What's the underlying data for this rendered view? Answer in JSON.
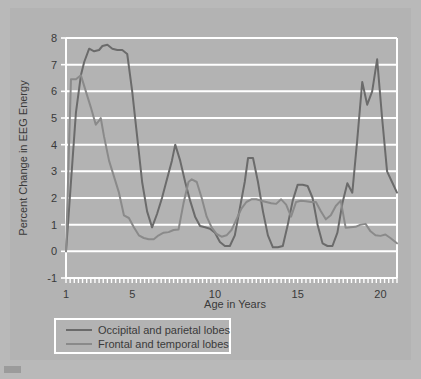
{
  "figure": {
    "background_color": "#b3b3b3",
    "page_background_color": "#b9b9b9",
    "grid_color": "#ffffff",
    "axis_color": "#ffffff",
    "text_color": "#3a3a3a"
  },
  "chart_data": {
    "type": "line",
    "title": "",
    "xlabel": "Age in Years",
    "ylabel": "Percent Change in EEG Energy",
    "xlim": [
      1,
      21
    ],
    "ylim": [
      -1,
      8
    ],
    "xticks": [
      1,
      5,
      10,
      15,
      20
    ],
    "xtick_labels": [
      "1",
      "5",
      "10",
      "15",
      "20"
    ],
    "yticks": [
      -1,
      0,
      1,
      2,
      3,
      4,
      5,
      6,
      7,
      8
    ],
    "ytick_labels": [
      "-1",
      "0",
      "1",
      "2",
      "3",
      "4",
      "5",
      "6",
      "7",
      "8"
    ],
    "minor_xticks_step": 0.25,
    "grid": "horizontal",
    "legend_position": "below-axes",
    "series": [
      {
        "name": "Occipital and parietal lobes",
        "color": "#6b6b6b",
        "x": [
          1.0,
          1.3,
          1.6,
          1.9,
          2.1,
          2.4,
          2.7,
          3.0,
          3.2,
          3.5,
          3.8,
          4.1,
          4.4,
          4.7,
          5.0,
          5.3,
          5.6,
          5.9,
          6.2,
          6.5,
          6.8,
          7.1,
          7.4,
          7.6,
          7.9,
          8.2,
          8.5,
          8.8,
          9.1,
          9.4,
          9.7,
          10.0,
          10.3,
          10.6,
          10.9,
          11.2,
          11.5,
          11.8,
          12.0,
          12.3,
          12.6,
          12.9,
          13.2,
          13.5,
          13.8,
          14.1,
          14.4,
          14.7,
          15.0,
          15.3,
          15.6,
          15.9,
          16.2,
          16.5,
          16.8,
          17.1,
          17.4,
          17.7,
          18.0,
          18.3,
          18.6,
          18.9,
          19.2,
          19.5,
          19.8,
          20.1,
          20.4,
          20.7,
          21.0
        ],
        "y": [
          0.0,
          2.6,
          5.2,
          6.6,
          7.1,
          7.6,
          7.5,
          7.55,
          7.7,
          7.75,
          7.6,
          7.55,
          7.55,
          7.4,
          6.0,
          4.3,
          2.6,
          1.5,
          0.9,
          1.4,
          2.0,
          2.7,
          3.4,
          4.0,
          3.4,
          2.6,
          1.9,
          1.3,
          0.95,
          0.9,
          0.85,
          0.7,
          0.35,
          0.2,
          0.2,
          0.6,
          1.6,
          2.6,
          3.5,
          3.5,
          2.6,
          1.5,
          0.6,
          0.15,
          0.15,
          0.2,
          1.0,
          1.9,
          2.5,
          2.5,
          2.45,
          2.0,
          1.0,
          0.3,
          0.2,
          0.2,
          0.7,
          1.8,
          2.55,
          2.2,
          4.2,
          6.35,
          5.5,
          6.0,
          7.2,
          5.0,
          3.0,
          2.6,
          2.2
        ]
      },
      {
        "name": "Frontal and temporal lobes",
        "color": "#8a8a8a",
        "x": [
          1.0,
          1.15,
          1.3,
          1.6,
          1.9,
          2.2,
          2.5,
          2.8,
          3.0,
          3.1,
          3.3,
          3.6,
          3.9,
          4.2,
          4.5,
          4.8,
          5.1,
          5.4,
          5.7,
          6.0,
          6.3,
          6.6,
          6.9,
          7.2,
          7.5,
          7.8,
          8.1,
          8.4,
          8.6,
          8.9,
          9.2,
          9.5,
          9.8,
          10.1,
          10.4,
          10.7,
          11.0,
          11.3,
          11.6,
          11.9,
          12.2,
          12.5,
          12.8,
          13.1,
          13.4,
          13.7,
          14.0,
          14.3,
          14.6,
          14.9,
          15.2,
          15.5,
          15.8,
          16.1,
          16.4,
          16.7,
          17.0,
          17.3,
          17.6,
          17.9,
          18.2,
          18.5,
          18.8,
          19.1,
          19.4,
          19.7,
          20.0,
          20.3,
          20.6,
          21.0
        ],
        "y": [
          0.0,
          3.2,
          6.45,
          6.45,
          6.6,
          6.0,
          5.4,
          4.75,
          4.9,
          5.0,
          4.3,
          3.4,
          2.8,
          2.2,
          1.35,
          1.25,
          0.9,
          0.6,
          0.5,
          0.45,
          0.45,
          0.6,
          0.7,
          0.72,
          0.8,
          0.82,
          1.8,
          2.6,
          2.7,
          2.6,
          2.0,
          1.3,
          0.9,
          0.65,
          0.55,
          0.6,
          0.8,
          1.2,
          1.6,
          1.85,
          1.95,
          1.95,
          1.9,
          1.85,
          1.8,
          1.78,
          1.95,
          1.75,
          1.3,
          1.85,
          1.9,
          1.88,
          1.85,
          1.85,
          1.5,
          1.2,
          1.35,
          1.7,
          1.9,
          0.88,
          0.9,
          0.92,
          1.0,
          1.03,
          0.75,
          0.6,
          0.58,
          0.63,
          0.5,
          0.3
        ]
      }
    ]
  },
  "legend": {
    "items": [
      {
        "label": "Occipital and parietal lobes",
        "color": "#6b6b6b"
      },
      {
        "label": "Frontal and temporal lobes",
        "color": "#8a8a8a"
      }
    ]
  }
}
